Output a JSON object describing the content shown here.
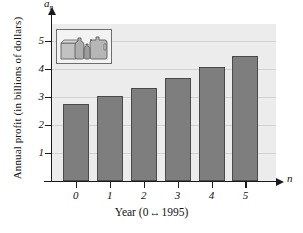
{
  "chart_data": {
    "type": "bar",
    "title": "",
    "subtitle": "",
    "xlabel": "Year (0 ↔1995)",
    "ylabel": "Annual profit (in billions of dollars)",
    "x_variable": "n",
    "y_variable": "a",
    "y_variable_subscript": "n",
    "categories": [
      "0",
      "1",
      "2",
      "3",
      "4",
      "5"
    ],
    "values": [
      2.75,
      3.03,
      3.33,
      3.67,
      4.05,
      4.45
    ],
    "xlim": [
      -0.7,
      5.9
    ],
    "ylim": [
      0,
      5.6
    ],
    "yticks": [
      "1",
      "2",
      "3",
      "4",
      "5"
    ],
    "ytick_values": [
      1,
      2,
      3,
      4,
      5
    ],
    "xticks": [
      "0",
      "1",
      "2",
      "3",
      "4",
      "5"
    ],
    "grid": "horizontal",
    "legend": "none",
    "series_name": "Annual profit",
    "units": "billions of dollars",
    "bar_color": "#7e7e7e",
    "bar_edge_color": "#4a4a4a",
    "plot_background": "#ececec",
    "gridline_color": "#d2d2d2",
    "axis_color": "#1a1a1a"
  },
  "xlabel_parts": {
    "prefix": "Year (0",
    "arrows": "↔",
    "suffix": "1995)"
  },
  "inset": {
    "name": "product-illustration",
    "description": "bottles and containers"
  }
}
